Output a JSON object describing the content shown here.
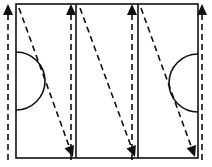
{
  "diagram": {
    "type": "drill-pattern",
    "colors": {
      "line": "#111111",
      "background": "#ffffff"
    },
    "field": {
      "x1": 16,
      "y1": 4,
      "x2": 198,
      "y2": 158
    },
    "lane_dividers_x": [
      76,
      138
    ],
    "semicircles": [
      {
        "name": "left-goal-area",
        "cx": 16,
        "cy": 81,
        "r": 29,
        "side": "left"
      },
      {
        "name": "right-goal-area",
        "cx": 198,
        "cy": 83,
        "r": 29,
        "side": "right"
      }
    ],
    "up_runs": [
      {
        "x": 8,
        "y_start": 160,
        "y_end": 4
      },
      {
        "x": 71,
        "y_start": 160,
        "y_end": 4
      },
      {
        "x": 132,
        "y_start": 160,
        "y_end": 4
      },
      {
        "x": 202,
        "y_start": 160,
        "y_end": 4
      }
    ],
    "diagonal_runs": [
      {
        "x1": 19,
        "y1": 8,
        "x2": 73,
        "y2": 157
      },
      {
        "x1": 80,
        "y1": 8,
        "x2": 135,
        "y2": 157
      },
      {
        "x1": 141,
        "y1": 8,
        "x2": 195,
        "y2": 157
      }
    ]
  }
}
